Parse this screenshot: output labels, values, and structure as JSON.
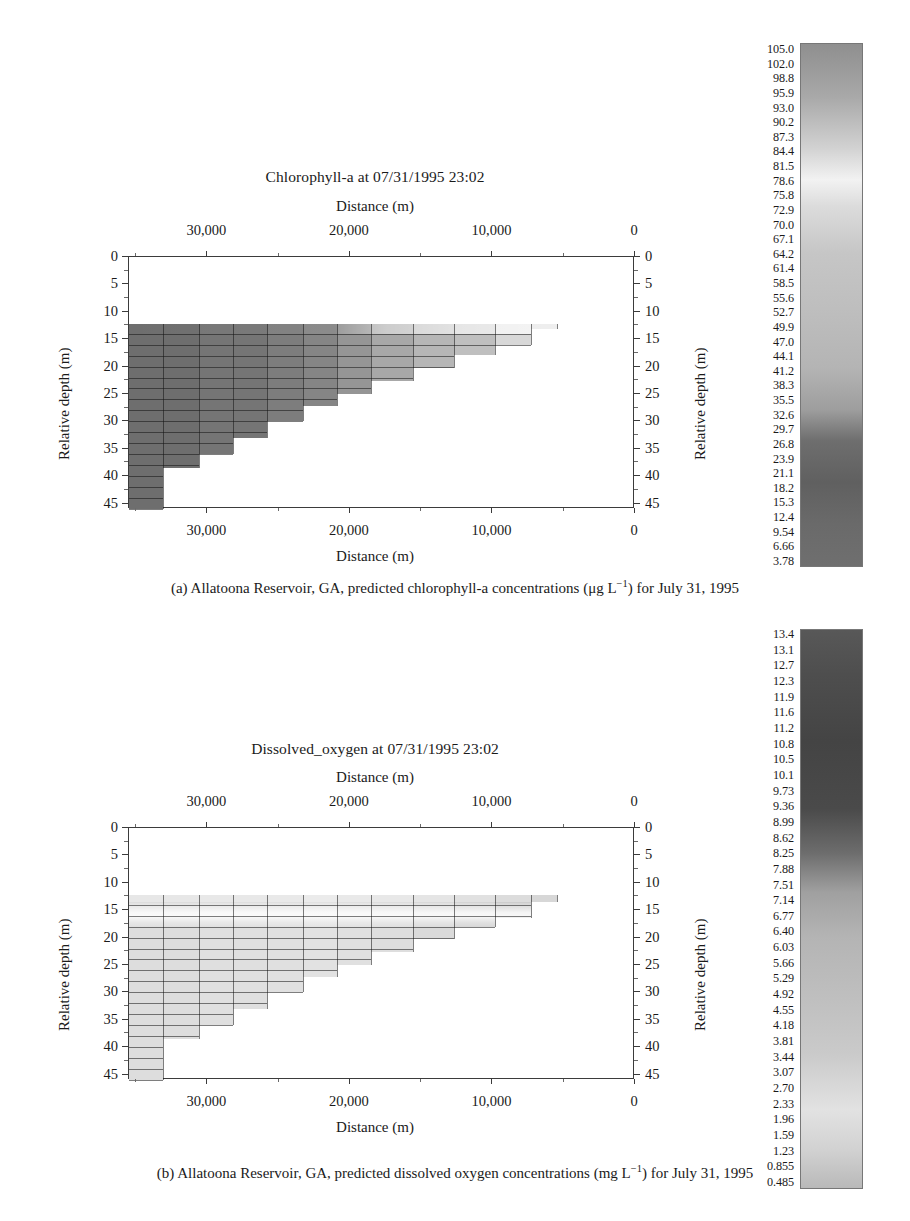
{
  "panels": [
    {
      "id": "a",
      "title": "Chlorophyll-a at 07/31/1995 23:02",
      "axis_top_label": "Distance (m)",
      "axis_bottom_label": "Distance (m)",
      "ylabel_left": "Relative depth (m)",
      "ylabel_right": "Relative depth (m)",
      "xticks": [
        "30,000",
        "20,000",
        "10,000",
        "0"
      ],
      "yticks": [
        "0",
        "5",
        "10",
        "15",
        "20",
        "25",
        "30",
        "35",
        "40",
        "45"
      ],
      "caption_label": "(a)",
      "caption_text": "Allatoona Reservoir, GA, predicted chlorophyll-a concentrations (μg L",
      "caption_exp": "−1",
      "caption_tail": ") for July 31, 1995",
      "colorbar": {
        "ticks": [
          "105.0",
          "102.0",
          "98.8",
          "95.9",
          "93.0",
          "90.2",
          "87.3",
          "84.4",
          "81.5",
          "78.6",
          "75.8",
          "72.9",
          "70.0",
          "67.1",
          "64.2",
          "61.4",
          "58.5",
          "55.6",
          "52.7",
          "49.9",
          "47.0",
          "44.1",
          "41.2",
          "38.3",
          "35.5",
          "32.6",
          "29.7",
          "26.8",
          "23.9",
          "21.1",
          "18.2",
          "15.3",
          "12.4",
          "9.54",
          "6.66",
          "3.78"
        ],
        "max": 105.0,
        "min": 3.78,
        "units": "μg L−1",
        "stops": [
          {
            "pos": 0,
            "color": "#8f8f8f"
          },
          {
            "pos": 10,
            "color": "#a8a8a8"
          },
          {
            "pos": 20,
            "color": "#d2d2d2"
          },
          {
            "pos": 26,
            "color": "#f2f2f2"
          },
          {
            "pos": 31,
            "color": "#dcdcdc"
          },
          {
            "pos": 40,
            "color": "#c6c6c6"
          },
          {
            "pos": 52,
            "color": "#bdbdbd"
          },
          {
            "pos": 62,
            "color": "#b4b4b4"
          },
          {
            "pos": 70,
            "color": "#9e9e9e"
          },
          {
            "pos": 76,
            "color": "#6e6e6e"
          },
          {
            "pos": 84,
            "color": "#606060"
          },
          {
            "pos": 92,
            "color": "#6a6a6a"
          },
          {
            "pos": 100,
            "color": "#6f6f6f"
          }
        ]
      }
    },
    {
      "id": "b",
      "title": "Dissolved_oxygen at 07/31/1995 23:02",
      "axis_top_label": "Distance (m)",
      "axis_bottom_label": "Distance (m)",
      "ylabel_left": "Relative depth (m)",
      "ylabel_right": "Relative depth (m)",
      "xticks": [
        "30,000",
        "20,000",
        "10,000",
        "0"
      ],
      "yticks": [
        "0",
        "5",
        "10",
        "15",
        "20",
        "25",
        "30",
        "35",
        "40",
        "45"
      ],
      "caption_label": "(b)",
      "caption_text": "Allatoona Reservoir, GA, predicted dissolved oxygen concentrations (mg L",
      "caption_exp": "−1",
      "caption_tail": ") for July 31, 1995",
      "colorbar": {
        "ticks": [
          "13.4",
          "13.1",
          "12.7",
          "12.3",
          "11.9",
          "11.6",
          "11.2",
          "10.8",
          "10.5",
          "10.1",
          "9.73",
          "9.36",
          "8.99",
          "8.62",
          "8.25",
          "7.88",
          "7.51",
          "7.14",
          "6.77",
          "6.40",
          "6.03",
          "5.66",
          "5.29",
          "4.92",
          "4.55",
          "4.18",
          "3.81",
          "3.44",
          "3.07",
          "2.70",
          "2.33",
          "1.96",
          "1.59",
          "1.23",
          "0.855",
          "0.485"
        ],
        "max": 13.4,
        "min": 0.485,
        "units": "mg L−1",
        "stops": [
          {
            "pos": 0,
            "color": "#585858"
          },
          {
            "pos": 8,
            "color": "#4e4e4e"
          },
          {
            "pos": 20,
            "color": "#444444"
          },
          {
            "pos": 32,
            "color": "#4a4a4a"
          },
          {
            "pos": 40,
            "color": "#6d6d6d"
          },
          {
            "pos": 47,
            "color": "#a0a0a0"
          },
          {
            "pos": 55,
            "color": "#b4b4b4"
          },
          {
            "pos": 66,
            "color": "#bfbfbf"
          },
          {
            "pos": 76,
            "color": "#cacaca"
          },
          {
            "pos": 86,
            "color": "#e2e2e2"
          },
          {
            "pos": 93,
            "color": "#d2d2d2"
          },
          {
            "pos": 100,
            "color": "#b9b9b9"
          }
        ]
      }
    }
  ],
  "chart_data": [
    {
      "type": "heatmap",
      "title": "Chlorophyll-a at 07/31/1995 23:02",
      "xlabel": "Distance (m)",
      "ylabel": "Relative depth (m)",
      "xlim": [
        35500,
        0
      ],
      "ylim": [
        46,
        0
      ],
      "xticks": [
        30000,
        20000,
        10000,
        0
      ],
      "yticks": [
        0,
        5,
        10,
        15,
        20,
        25,
        30,
        35,
        40,
        45
      ],
      "grid": true,
      "colorbar_range": [
        3.78,
        105.0
      ],
      "colorbar_units": "μg L−1",
      "legend_position": "right",
      "segments": [
        {
          "x0": 35500,
          "x1": 33100,
          "top": 12.2,
          "bottom": 46.0,
          "value": 28
        },
        {
          "x0": 33100,
          "x1": 30600,
          "top": 12.2,
          "bottom": 38.6,
          "value": 28
        },
        {
          "x0": 30600,
          "x1": 28200,
          "top": 12.2,
          "bottom": 36.0,
          "value": 29
        },
        {
          "x0": 28200,
          "x1": 25800,
          "top": 12.2,
          "bottom": 33.0,
          "value": 29
        },
        {
          "x0": 25800,
          "x1": 23300,
          "top": 12.2,
          "bottom": 30.0,
          "value": 30
        },
        {
          "x0": 23300,
          "x1": 20900,
          "top": 12.2,
          "bottom": 27.2,
          "value": 31
        },
        {
          "x0": 20900,
          "x1": 18500,
          "top": 12.2,
          "bottom": 25.0,
          "value": 33
        },
        {
          "x0": 18500,
          "x1": 15600,
          "top": 12.2,
          "bottom": 22.6,
          "value": 38
        },
        {
          "x0": 15600,
          "x1": 12700,
          "top": 12.2,
          "bottom": 20.2,
          "value": 44
        },
        {
          "x0": 12700,
          "x1": 9800,
          "top": 12.2,
          "bottom": 17.8,
          "value": 55
        },
        {
          "x0": 9800,
          "x1": 7300,
          "top": 12.2,
          "bottom": 16.0,
          "value": 72
        },
        {
          "x0": 7300,
          "x1": 5500,
          "top": 12.2,
          "bottom": 13.2,
          "value": 88
        }
      ],
      "surface_band": {
        "top": 12.2,
        "bottom": 14.0,
        "note": "bright near-surface layer upstream to downstream"
      }
    },
    {
      "type": "heatmap",
      "title": "Dissolved_oxygen at 07/31/1995 23:02",
      "xlabel": "Distance (m)",
      "ylabel": "Relative depth (m)",
      "xlim": [
        35500,
        0
      ],
      "ylim": [
        46,
        0
      ],
      "xticks": [
        30000,
        20000,
        10000,
        0
      ],
      "yticks": [
        0,
        5,
        10,
        15,
        20,
        25,
        30,
        35,
        40,
        45
      ],
      "grid": true,
      "colorbar_range": [
        0.485,
        13.4
      ],
      "colorbar_units": "mg L−1",
      "legend_position": "right",
      "segments": [
        {
          "x0": 35500,
          "x1": 33100,
          "top": 12.2,
          "bottom": 46.0,
          "value": 2.0
        },
        {
          "x0": 33100,
          "x1": 30600,
          "top": 12.2,
          "bottom": 38.6,
          "value": 2.0
        },
        {
          "x0": 30600,
          "x1": 28200,
          "top": 12.2,
          "bottom": 36.0,
          "value": 2.1
        },
        {
          "x0": 28200,
          "x1": 25800,
          "top": 12.2,
          "bottom": 33.0,
          "value": 2.1
        },
        {
          "x0": 25800,
          "x1": 23300,
          "top": 12.2,
          "bottom": 30.0,
          "value": 2.2
        },
        {
          "x0": 23300,
          "x1": 20900,
          "top": 12.2,
          "bottom": 27.2,
          "value": 2.3
        },
        {
          "x0": 20900,
          "x1": 18500,
          "top": 12.2,
          "bottom": 25.0,
          "value": 2.4
        },
        {
          "x0": 18500,
          "x1": 15600,
          "top": 12.2,
          "bottom": 22.6,
          "value": 2.5
        },
        {
          "x0": 15600,
          "x1": 12700,
          "top": 12.2,
          "bottom": 20.2,
          "value": 2.7
        },
        {
          "x0": 12700,
          "x1": 9800,
          "top": 12.2,
          "bottom": 18.0,
          "value": 3.0
        },
        {
          "x0": 9800,
          "x1": 7300,
          "top": 12.2,
          "bottom": 16.4,
          "value": 3.4
        },
        {
          "x0": 7300,
          "x1": 5500,
          "top": 12.2,
          "bottom": 13.6,
          "value": 4.0
        }
      ],
      "oxygen_maximum_band": {
        "top": 14.0,
        "bottom": 18.0,
        "value": 11.5,
        "note": "bright metalimnetic oxygen maximum"
      }
    }
  ]
}
